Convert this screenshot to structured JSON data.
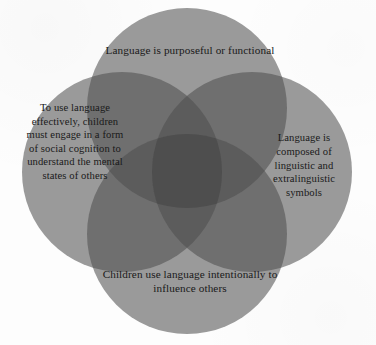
{
  "figure": {
    "type": "four-circle-venn",
    "background_color": "#fdfdfd",
    "text_color": "#191919",
    "circle_fill": "#9a9a9a",
    "overlap_two_fill": "#6f6f6f",
    "overlap_three_fill": "#5c5c5c",
    "overlap_center_fill": "#4e4e4e",
    "circle_diameter": 200,
    "canvas_width": 376,
    "canvas_height": 345
  },
  "circles": {
    "top": {
      "position": "top",
      "cx": 187,
      "cy": 108,
      "r": 100,
      "text": "Language is purposeful or functional",
      "lines": [
        "Language is purposeful or",
        "functional"
      ]
    },
    "right": {
      "position": "right",
      "cx": 252,
      "cy": 172,
      "r": 100,
      "text": "Language is composed of linguistic and extralinguistic symbols",
      "lines": [
        "Language is",
        "composed of",
        "linguistic and",
        "extralinguistic",
        "symbols"
      ]
    },
    "bottom": {
      "position": "bottom",
      "cx": 187,
      "cy": 234,
      "r": 100,
      "text": "Children use language intentionally to influence others",
      "lines": [
        "Children use language",
        "intentionally to influence",
        "others"
      ]
    },
    "left": {
      "position": "left",
      "cx": 122,
      "cy": 172,
      "r": 100,
      "text": "To use language effectively, children must engage in a form of social cognition to understand the mental states of others",
      "lines": [
        "To use",
        "language",
        "effectively,",
        "children must",
        "engage in a",
        "form of social",
        "cognition to",
        "understand the",
        "mental states",
        "of others"
      ]
    }
  }
}
